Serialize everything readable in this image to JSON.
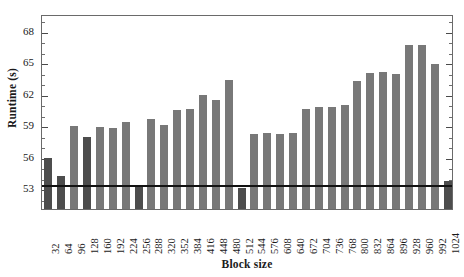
{
  "chart_data": {
    "type": "bar",
    "title": "",
    "subtitle": "",
    "xlabel": "Block size",
    "ylabel": "Runtime (s)",
    "ylim": [
      51.0,
      69.6
    ],
    "yticks": [
      53,
      56,
      59,
      62,
      65,
      68
    ],
    "ytick_labels": [
      "53",
      "56",
      "59",
      "62",
      "65",
      "68"
    ],
    "grid": false,
    "legend": null,
    "categories": [
      "32",
      "64",
      "96",
      "128",
      "160",
      "192",
      "224",
      "256",
      "288",
      "320",
      "352",
      "384",
      "416",
      "448",
      "480",
      "512",
      "544",
      "576",
      "608",
      "640",
      "672",
      "704",
      "736",
      "768",
      "800",
      "832",
      "864",
      "896",
      "928",
      "960",
      "992",
      "1024"
    ],
    "values": [
      56.1,
      54.3,
      59.1,
      58.1,
      59.0,
      58.9,
      59.5,
      53.5,
      59.8,
      59.2,
      60.6,
      60.7,
      62.1,
      61.6,
      63.5,
      53.2,
      58.3,
      58.4,
      58.3,
      58.4,
      60.7,
      60.9,
      60.9,
      61.1,
      63.4,
      64.2,
      64.3,
      64.1,
      66.8,
      66.8,
      65.0,
      53.9
    ],
    "bar_colors": [
      "#4d4d4d",
      "#4d4d4d",
      "#787878",
      "#4d4d4d",
      "#787878",
      "#787878",
      "#787878",
      "#4d4d4d",
      "#787878",
      "#787878",
      "#787878",
      "#787878",
      "#787878",
      "#787878",
      "#787878",
      "#4d4d4d",
      "#787878",
      "#787878",
      "#787878",
      "#787878",
      "#787878",
      "#787878",
      "#787878",
      "#787878",
      "#787878",
      "#787878",
      "#787878",
      "#787878",
      "#787878",
      "#787878",
      "#787878",
      "#4d4d4d"
    ],
    "annotations": [
      {
        "name": "baseline-reference-line",
        "type": "hline",
        "y": 53.4,
        "color": "#121212"
      }
    ],
    "colors": {
      "bar_default": "#787878",
      "bar_power_of_two": "#4d4d4d",
      "reference_line": "#121212",
      "axis": "#6a6a6a",
      "text": "#1a1a1a",
      "background": "#ffffff"
    }
  }
}
